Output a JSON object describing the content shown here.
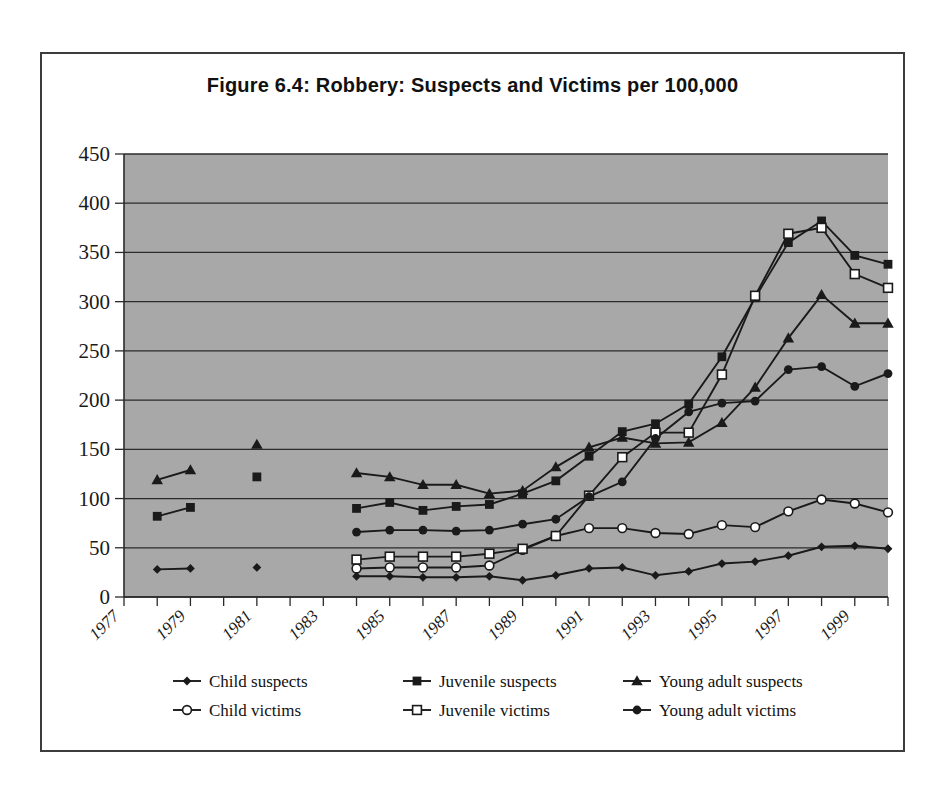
{
  "figure": {
    "title": "Figure 6.4: Robbery: Suspects and Victims per 100,000",
    "plot_bg": "#a8a8a8",
    "frame_color": "#3c3c3c",
    "series_color": "#1a1a1a"
  },
  "chart_data": {
    "type": "line",
    "title": "Figure 6.4: Robbery: Suspects and Victims per 100,000",
    "xlabel": "",
    "ylabel": "",
    "ylim": [
      0,
      450
    ],
    "ytick_step": 50,
    "yticks": [
      0,
      50,
      100,
      150,
      200,
      250,
      300,
      350,
      400,
      450
    ],
    "grid": true,
    "legend_position": "bottom",
    "xlim": [
      1977,
      2000
    ],
    "x": [
      1977,
      1978,
      1979,
      1980,
      1981,
      1982,
      1983,
      1984,
      1985,
      1986,
      1987,
      1988,
      1989,
      1990,
      1991,
      1992,
      1993,
      1994,
      1995,
      1996,
      1997,
      1998,
      1999,
      2000
    ],
    "xticklabels": [
      "1977",
      "",
      "1979",
      "",
      "1981",
      "",
      "1983",
      "",
      "1985",
      "",
      "1987",
      "",
      "1989",
      "",
      "1991",
      "",
      "1993",
      "",
      "1995",
      "",
      "1997",
      "",
      "1999",
      ""
    ],
    "series": [
      {
        "name": "Child suspects",
        "marker": "filled-diamond",
        "values": [
          null,
          28,
          29,
          null,
          30,
          null,
          null,
          21,
          21,
          20,
          20,
          21,
          17,
          22,
          29,
          30,
          22,
          26,
          34,
          36,
          42,
          51,
          52,
          49
        ]
      },
      {
        "name": "Juvenile suspects",
        "marker": "filled-square",
        "values": [
          null,
          82,
          91,
          null,
          122,
          null,
          null,
          90,
          96,
          88,
          92,
          94,
          105,
          118,
          143,
          168,
          176,
          196,
          244,
          304,
          360,
          382,
          347,
          338
        ]
      },
      {
        "name": "Young adult suspects",
        "marker": "filled-triangle",
        "values": [
          null,
          119,
          129,
          null,
          155,
          null,
          null,
          126,
          122,
          114,
          114,
          105,
          108,
          132,
          152,
          162,
          156,
          157,
          177,
          213,
          263,
          307,
          278,
          278
        ]
      },
      {
        "name": "Child victims",
        "marker": "open-circle",
        "values": [
          null,
          null,
          null,
          null,
          null,
          null,
          null,
          29,
          30,
          30,
          30,
          32,
          48,
          62,
          70,
          70,
          65,
          64,
          73,
          71,
          87,
          99,
          95,
          86
        ]
      },
      {
        "name": "Juvenile victims",
        "marker": "open-square",
        "values": [
          null,
          null,
          null,
          null,
          null,
          null,
          null,
          38,
          41,
          41,
          41,
          44,
          49,
          62,
          103,
          142,
          167,
          167,
          226,
          306,
          369,
          375,
          328,
          314
        ]
      },
      {
        "name": "Young adult victims",
        "marker": "filled-circle",
        "values": [
          null,
          null,
          null,
          null,
          null,
          null,
          null,
          66,
          68,
          68,
          67,
          68,
          74,
          79,
          102,
          117,
          161,
          188,
          197,
          199,
          231,
          234,
          214,
          227
        ]
      }
    ]
  },
  "legend": {
    "entries": [
      {
        "label": "Child suspects",
        "marker": "filled-diamond"
      },
      {
        "label": "Juvenile suspects",
        "marker": "filled-square"
      },
      {
        "label": "Young adult suspects",
        "marker": "filled-triangle"
      },
      {
        "label": "Child victims",
        "marker": "open-circle"
      },
      {
        "label": "Juvenile victims",
        "marker": "open-square"
      },
      {
        "label": "Young adult victims",
        "marker": "filled-circle"
      }
    ]
  }
}
